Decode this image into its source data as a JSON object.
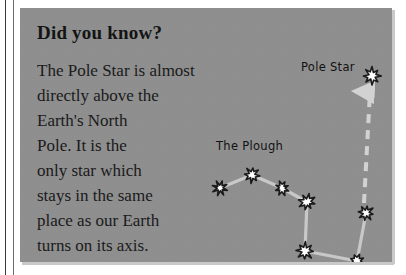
{
  "panel": {
    "heading": "Did you know?",
    "body_lines": [
      "The Pole Star is almost",
      "directly above the",
      "Earth's North",
      "Pole. It is the",
      "only star which",
      "stays in the same",
      "place as our Earth",
      "turns on its axis."
    ],
    "background_color": "#909090",
    "text_color": "#1a1a1a"
  },
  "diagram": {
    "name": "pole-star-and-plough-star-chart",
    "labels": {
      "pole_star": "Pole Star",
      "the_plough": "The Plough"
    },
    "star_color": "#ffffff",
    "star_outline_color": "#1a1a1a",
    "link_color": "#c8c8c8",
    "pointer_line_color": "#d2d2d2",
    "pointer_line_style": "dashed-with-arrowhead",
    "pointer_line_meaning": "pointer from The Plough to the Pole Star",
    "stars": [
      {
        "name": "pole-star",
        "x": 352,
        "y": 68,
        "size": 19
      },
      {
        "name": "plough-star-1",
        "x": 200,
        "y": 180,
        "size": 16
      },
      {
        "name": "plough-star-2",
        "x": 232,
        "y": 167,
        "size": 17
      },
      {
        "name": "plough-star-3",
        "x": 262,
        "y": 180,
        "size": 16
      },
      {
        "name": "plough-star-4",
        "x": 287,
        "y": 194,
        "size": 18
      },
      {
        "name": "plough-star-5",
        "x": 285,
        "y": 243,
        "size": 19
      },
      {
        "name": "plough-star-6",
        "x": 337,
        "y": 253,
        "size": 16
      },
      {
        "name": "plough-star-7",
        "x": 346,
        "y": 205,
        "size": 17
      }
    ],
    "links": [
      [
        "plough-star-1",
        "plough-star-2"
      ],
      [
        "plough-star-2",
        "plough-star-3"
      ],
      [
        "plough-star-3",
        "plough-star-4"
      ],
      [
        "plough-star-4",
        "plough-star-5"
      ],
      [
        "plough-star-5",
        "plough-star-6"
      ],
      [
        "plough-star-6",
        "plough-star-7"
      ]
    ],
    "pointer": {
      "from": "plough-star-7",
      "to": "pole-star"
    }
  }
}
